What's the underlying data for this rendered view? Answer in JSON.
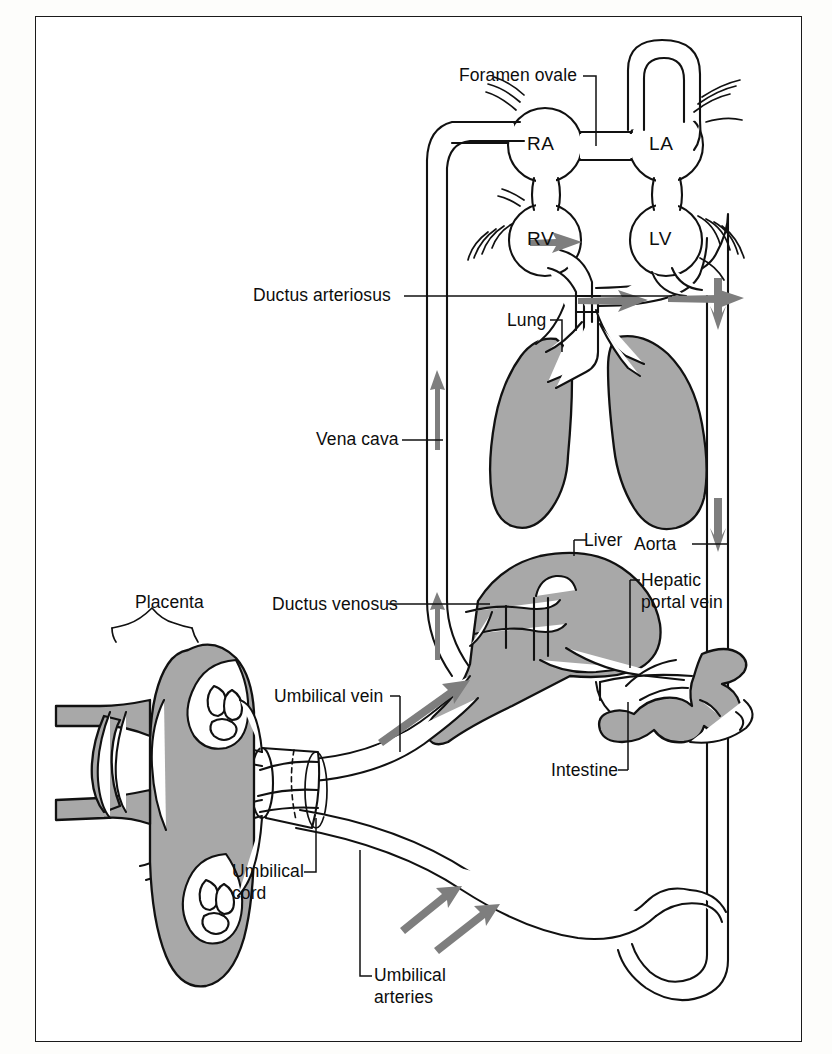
{
  "diagram": {
    "frame": {
      "border_color": "#1a1a1a",
      "background": "#ffffff"
    },
    "palette": {
      "organ_fill": "#a8a8a8",
      "outline": "#111111",
      "vessel_fill": "#ffffff",
      "arrow_gray": "#808080",
      "text": "#0d0d0d"
    }
  },
  "chambers": [
    {
      "id": "RA",
      "label": "RA",
      "name": "right-atrium"
    },
    {
      "id": "LA",
      "label": "LA",
      "name": "left-atrium"
    },
    {
      "id": "RV",
      "label": "RV",
      "name": "right-ventricle"
    },
    {
      "id": "LV",
      "label": "LV",
      "name": "left-ventricle"
    }
  ],
  "labels": [
    {
      "key": "foramen_ovale",
      "text": "Foramen ovale",
      "name": "label-foramen-ovale"
    },
    {
      "key": "ductus_arteriosus",
      "text": "Ductus arteriosus",
      "name": "label-ductus-arteriosus"
    },
    {
      "key": "lung",
      "text": "Lung",
      "name": "label-lung"
    },
    {
      "key": "vena_cava",
      "text": "Vena cava",
      "name": "label-vena-cava"
    },
    {
      "key": "liver",
      "text": "Liver",
      "name": "label-liver"
    },
    {
      "key": "aorta",
      "text": "Aorta",
      "name": "label-aorta"
    },
    {
      "key": "placenta",
      "text": "Placenta",
      "name": "label-placenta"
    },
    {
      "key": "ductus_venosus",
      "text": "Ductus venosus",
      "name": "label-ductus-venosus"
    },
    {
      "key": "hepatic_portal_1",
      "text": "Hepatic",
      "name": "label-hepatic-portal-vein-line1"
    },
    {
      "key": "hepatic_portal_2",
      "text": "portal vein",
      "name": "label-hepatic-portal-vein-line2"
    },
    {
      "key": "umbilical_vein",
      "text": "Umbilical vein",
      "name": "label-umbilical-vein"
    },
    {
      "key": "intestine",
      "text": "Intestine",
      "name": "label-intestine"
    },
    {
      "key": "umbilical_cord_1",
      "text": "Umbilical",
      "name": "label-umbilical-cord-line1"
    },
    {
      "key": "umbilical_cord_2",
      "text": "cord",
      "name": "label-umbilical-cord-line2"
    },
    {
      "key": "umbilical_art_1",
      "text": "Umbilical",
      "name": "label-umbilical-arteries-line1"
    },
    {
      "key": "umbilical_art_2",
      "text": "arteries",
      "name": "label-umbilical-arteries-line2"
    }
  ],
  "text": {
    "foramen_ovale": "Foramen ovale",
    "ductus_arteriosus": "Ductus arteriosus",
    "lung": "Lung",
    "vena_cava": "Vena cava",
    "liver": "Liver",
    "aorta": "Aorta",
    "placenta": "Placenta",
    "ductus_venosus": "Ductus venosus",
    "hepatic_portal_1": "Hepatic",
    "hepatic_portal_2": "portal vein",
    "umbilical_vein": "Umbilical vein",
    "intestine": "Intestine",
    "umbilical_cord_1": "Umbilical",
    "umbilical_cord_2": "cord",
    "umbilical_art_1": "Umbilical",
    "umbilical_art_2": "arteries",
    "RA": "RA",
    "LA": "LA",
    "RV": "RV",
    "LV": "LV"
  },
  "organs": [
    {
      "name": "lung-left",
      "fill": "#a8a8a8"
    },
    {
      "name": "lung-right",
      "fill": "#a8a8a8"
    },
    {
      "name": "liver",
      "fill": "#a8a8a8"
    },
    {
      "name": "intestine",
      "fill": "#a8a8a8"
    },
    {
      "name": "placenta",
      "fill": "#a8a8a8"
    }
  ],
  "flow_arrows": [
    {
      "name": "arrow-vena-cava-lower",
      "direction": "up"
    },
    {
      "name": "arrow-vena-cava-upper",
      "direction": "up"
    },
    {
      "name": "arrow-rv-outflow",
      "direction": "right-down"
    },
    {
      "name": "arrow-ductus-arteriosus",
      "direction": "right"
    },
    {
      "name": "arrow-lv-outflow",
      "direction": "right"
    },
    {
      "name": "arrow-aortic-arch",
      "direction": "down"
    },
    {
      "name": "arrow-descending-aorta",
      "direction": "down"
    },
    {
      "name": "arrow-umbilical-vein",
      "direction": "up-right"
    },
    {
      "name": "arrow-umbilical-artery-1",
      "direction": "up-left"
    },
    {
      "name": "arrow-umbilical-artery-2",
      "direction": "up-left"
    }
  ]
}
